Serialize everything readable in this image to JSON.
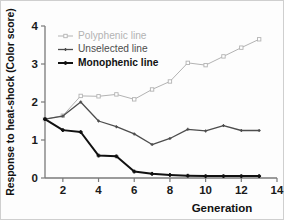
{
  "chart_data": {
    "type": "line",
    "title": "",
    "xlabel": "Generation",
    "ylabel": "Response to heat-shock (Color score)",
    "xlim": [
      1,
      14
    ],
    "ylim": [
      0,
      4
    ],
    "xticks": [
      2,
      4,
      6,
      8,
      10,
      12,
      14
    ],
    "yticks": [
      0,
      1,
      2,
      3,
      4
    ],
    "grid": false,
    "legend_position": "top-left",
    "x": [
      1,
      2,
      3,
      4,
      5,
      6,
      7,
      8,
      9,
      10,
      11,
      12,
      13
    ],
    "series": [
      {
        "name": "Polyphenic line",
        "color": "#b3b3b3",
        "marker": "square-open",
        "line_weight": "thin",
        "values": [
          1.55,
          1.64,
          2.16,
          2.15,
          2.2,
          2.07,
          2.33,
          2.54,
          3.03,
          2.97,
          3.2,
          3.43,
          3.65
        ]
      },
      {
        "name": "Unselected line",
        "color": "#4d4d4d",
        "marker": "plus",
        "line_weight": "medium",
        "values": [
          1.55,
          1.63,
          2.0,
          1.5,
          1.35,
          1.16,
          0.88,
          1.04,
          1.28,
          1.24,
          1.38,
          1.25,
          1.25
        ]
      },
      {
        "name": "Monophenic line",
        "color": "#111111",
        "marker": "plus-bold",
        "line_weight": "bold",
        "values": [
          1.55,
          1.26,
          1.21,
          0.59,
          0.57,
          0.17,
          0.11,
          0.08,
          0.06,
          0.05,
          0.05,
          0.05,
          0.05
        ]
      }
    ]
  },
  "axis": {
    "xlabel": "Generation",
    "ylabel": "Response to heat-shock (Color score)",
    "xticks": [
      "2",
      "4",
      "6",
      "8",
      "10",
      "12",
      "14"
    ],
    "yticks": [
      "0",
      "1",
      "2",
      "3",
      "4"
    ]
  },
  "legend": {
    "entries": [
      {
        "label": "Polyphenic line",
        "color": "#b3b3b3"
      },
      {
        "label": "Unselected line",
        "color": "#4d4d4d"
      },
      {
        "label": "Monophenic line",
        "color": "#111111"
      }
    ]
  }
}
